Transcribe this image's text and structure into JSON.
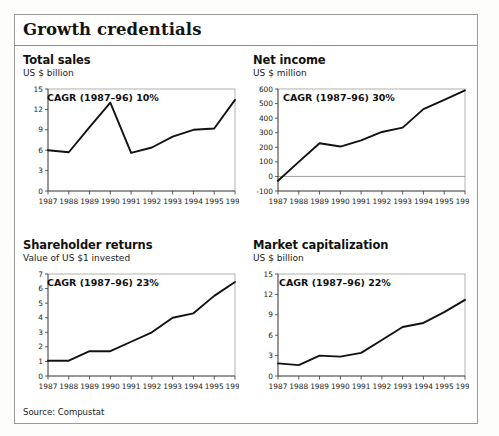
{
  "exhibit": {
    "title": "Growth credentials",
    "source": "Source: Compustat"
  },
  "panels": [
    {
      "key": "total-sales",
      "title": "Total sales",
      "subtitle": "US $ billion",
      "cagr": "CAGR (1987–96) 10%"
    },
    {
      "key": "net-income",
      "title": "Net income",
      "subtitle": "US $ million",
      "cagr": "CAGR (1987–96) 30%"
    },
    {
      "key": "shareholder-returns",
      "title": "Shareholder returns",
      "subtitle": "Value of US $1 invested",
      "cagr": "CAGR (1987–96) 23%"
    },
    {
      "key": "market-capitalization",
      "title": "Market capitalization",
      "subtitle": "US $ billion",
      "cagr": "CAGR (1987–96) 22%"
    }
  ],
  "chart_data": [
    {
      "type": "line",
      "title": "Total sales",
      "subtitle": "US $ billion",
      "annotation": "CAGR (1987–96) 10%",
      "xlabel": "",
      "ylabel": "US $ billion",
      "categories": [
        1987,
        1988,
        1989,
        1990,
        1991,
        1992,
        1993,
        1994,
        1995,
        1996
      ],
      "xticklabels": [
        "1987",
        "1988",
        "1989",
        "1990",
        "1991",
        "1992",
        "1993",
        "1994",
        "1995",
        "1996"
      ],
      "yticks": [
        0,
        3,
        6,
        9,
        12,
        15
      ],
      "ylim": [
        0,
        15
      ],
      "grid": false,
      "legend": "none",
      "values": [
        6.0,
        5.7,
        9.4,
        13.0,
        5.6,
        6.4,
        8.0,
        9.0,
        9.2,
        13.4
      ]
    },
    {
      "type": "line",
      "title": "Net income",
      "subtitle": "US $ million",
      "annotation": "CAGR (1987–96) 30%",
      "xlabel": "",
      "ylabel": "US $ million",
      "categories": [
        1987,
        1988,
        1989,
        1990,
        1991,
        1992,
        1993,
        1994,
        1995,
        1996
      ],
      "xticklabels": [
        "1987",
        "1988",
        "1989",
        "1990",
        "1991",
        "1992",
        "1993",
        "1994",
        "1995",
        "1996"
      ],
      "yticks": [
        -100,
        0,
        100,
        200,
        300,
        400,
        500,
        600
      ],
      "ylim": [
        -100,
        600
      ],
      "grid": false,
      "legend": "none",
      "zeroline": 0,
      "values": [
        -30,
        100,
        228,
        205,
        248,
        305,
        335,
        462,
        525,
        590
      ]
    },
    {
      "type": "line",
      "title": "Shareholder returns",
      "subtitle": "Value of US $1 invested",
      "annotation": "CAGR (1987–96) 23%",
      "xlabel": "",
      "ylabel": "Value of US $1 invested",
      "categories": [
        1987,
        1988,
        1989,
        1990,
        1991,
        1992,
        1993,
        1994,
        1995,
        1996
      ],
      "xticklabels": [
        "1987",
        "1988",
        "1989",
        "1990",
        "1991",
        "1992",
        "1993",
        "1994",
        "1995",
        "1996"
      ],
      "yticks": [
        0,
        1,
        2,
        3,
        4,
        5,
        6,
        7
      ],
      "ylim": [
        0,
        7
      ],
      "grid": false,
      "legend": "none",
      "values": [
        1.05,
        1.05,
        1.7,
        1.7,
        2.35,
        3.0,
        4.0,
        4.3,
        5.5,
        6.45
      ]
    },
    {
      "type": "line",
      "title": "Market capitalization",
      "subtitle": "US $ billion",
      "annotation": "CAGR (1987–96) 22%",
      "xlabel": "",
      "ylabel": "US $ billion",
      "categories": [
        1987,
        1988,
        1989,
        1990,
        1991,
        1992,
        1993,
        1994,
        1995,
        1996
      ],
      "xticklabels": [
        "1987",
        "1988",
        "1989",
        "1990",
        "1991",
        "1992",
        "1993",
        "1994",
        "1995",
        "1996"
      ],
      "yticks": [
        0,
        3,
        6,
        9,
        12,
        15
      ],
      "ylim": [
        0,
        15
      ],
      "grid": false,
      "legend": "none",
      "values": [
        1.85,
        1.6,
        3.0,
        2.85,
        3.4,
        5.3,
        7.2,
        7.8,
        9.4,
        11.2
      ]
    }
  ]
}
